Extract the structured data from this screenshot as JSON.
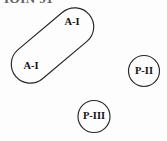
{
  "figure": {
    "background_color": "#fdfdfd",
    "stroke_color": "#262626",
    "label_color": "#131313",
    "width": 167,
    "height": 141,
    "clipped_header_text": "IOIN 91"
  },
  "shapes": [
    {
      "id": "stadium-a1",
      "kind": "stadium",
      "label_upper": "A-I",
      "label_lower": "A-I",
      "rotation_deg": -40,
      "center_x": 52.5,
      "center_y": 45.5,
      "length": 96,
      "thickness": 38
    },
    {
      "id": "circle-p2",
      "kind": "circle",
      "label": "P-II",
      "center_x": 144,
      "center_y": 71,
      "radius": 15.5
    },
    {
      "id": "circle-p3",
      "kind": "circle",
      "label": "P-III",
      "center_x": 94,
      "center_y": 116.5,
      "radius": 16
    }
  ],
  "labels": {
    "a1_upper": "A-I",
    "a1_lower": "A-I",
    "p2": "P-II",
    "p3": "P-III"
  }
}
